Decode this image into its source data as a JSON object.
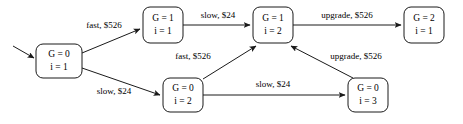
{
  "diagram": {
    "type": "state-transition-diagram",
    "background_color": "#ffffff",
    "stroke_color": "#1a1a1a",
    "text_color": "#000000",
    "nodes": [
      {
        "id": "n0",
        "line1": "G = 0",
        "line2": "i = 1",
        "x": 36,
        "y": 44,
        "w": 46,
        "h": 34,
        "is_start": true
      },
      {
        "id": "n1",
        "line1": "G = 1",
        "line2": "i = 1",
        "x": 143,
        "y": 7,
        "w": 40,
        "h": 36,
        "is_start": false
      },
      {
        "id": "n2",
        "line1": "G = 1",
        "line2": "i = 2",
        "x": 253,
        "y": 7,
        "w": 40,
        "h": 36,
        "is_start": false
      },
      {
        "id": "n3",
        "line1": "G = 2",
        "line2": "i = 1",
        "x": 404,
        "y": 7,
        "w": 40,
        "h": 36,
        "is_start": false
      },
      {
        "id": "n4",
        "line1": "G = 0",
        "line2": "i = 2",
        "x": 163,
        "y": 78,
        "w": 40,
        "h": 34,
        "is_start": false
      },
      {
        "id": "n5",
        "line1": "G = 0",
        "line2": "i = 3",
        "x": 348,
        "y": 78,
        "w": 40,
        "h": 34,
        "is_start": false
      }
    ],
    "edges": [
      {
        "id": "e-start",
        "from": "entry",
        "to": "n0",
        "label": "",
        "label_x": 0,
        "label_y": 0
      },
      {
        "id": "e0-1",
        "from": "n0",
        "to": "n1",
        "label": "fast, $526",
        "label_x": 104,
        "label_y": 26
      },
      {
        "id": "e1-2",
        "from": "n1",
        "to": "n2",
        "label": "slow, $24",
        "label_x": 218,
        "label_y": 16
      },
      {
        "id": "e2-3",
        "from": "n2",
        "to": "n3",
        "label": "upgrade, $526",
        "label_x": 347,
        "label_y": 16
      },
      {
        "id": "e0-4",
        "from": "n0",
        "to": "n4",
        "label": "slow, $24",
        "label_x": 114,
        "label_y": 92
      },
      {
        "id": "e4-2",
        "from": "n4",
        "to": "n2",
        "label": "fast, $526",
        "label_x": 193,
        "label_y": 57
      },
      {
        "id": "e4-5",
        "from": "n4",
        "to": "n5",
        "label": "slow, $24",
        "label_x": 273,
        "label_y": 85
      },
      {
        "id": "e5-2",
        "from": "n5",
        "to": "n2",
        "label": "upgrade, $526",
        "label_x": 356,
        "label_y": 57
      }
    ]
  }
}
